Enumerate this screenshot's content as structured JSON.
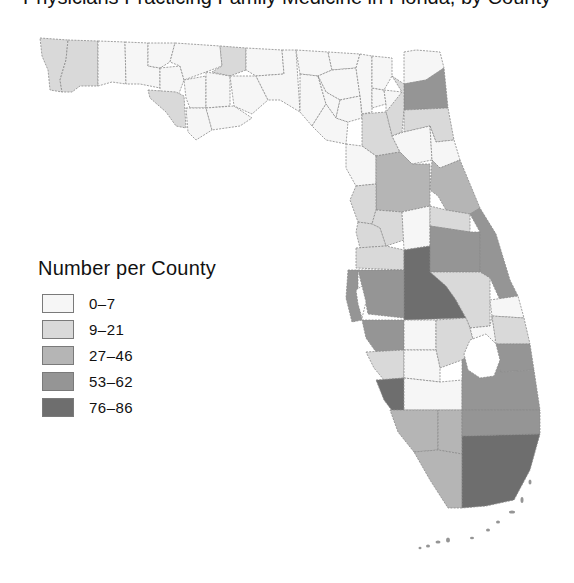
{
  "title": "Physicians Practicing Family Medicine in Florida, by County",
  "legend": {
    "title": "Number per County",
    "classes": [
      {
        "label": "0–7",
        "color": "#f6f6f6"
      },
      {
        "label": "9–21",
        "color": "#d9d9d9"
      },
      {
        "label": "27–46",
        "color": "#b5b5b5"
      },
      {
        "label": "53–62",
        "color": "#959595"
      },
      {
        "label": "76–86",
        "color": "#6e6e6e"
      }
    ]
  },
  "map": {
    "region": "Florida",
    "unit": "county",
    "features": [
      "panhandle",
      "peninsula",
      "Lake Okeechobee",
      "Florida Keys"
    ]
  }
}
